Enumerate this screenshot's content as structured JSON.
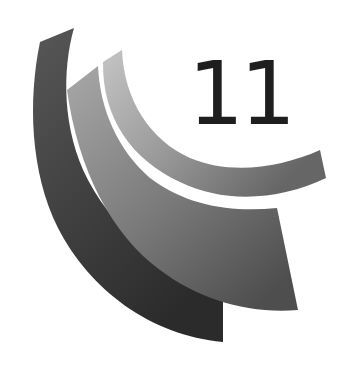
{
  "badge": {
    "number": "11"
  },
  "colors": {
    "outer_arc": "#4a4a4a",
    "outer_arc_dark": "#2e2e2e",
    "middle_arc": "#9a9a9a",
    "middle_arc_dark": "#555555",
    "inner_arc": "#bdbdbd",
    "inner_arc_dark": "#6a6a6a",
    "number": "#1e1e1e",
    "background": "#ffffff"
  },
  "icons": {
    "arcs": "three-concentric-arc-bands"
  }
}
